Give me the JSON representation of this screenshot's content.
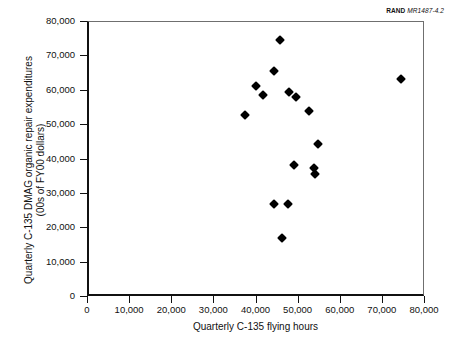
{
  "credit": {
    "brand": "RAND",
    "document_number": "MR1487-4.2"
  },
  "chart_data": {
    "type": "scatter",
    "title": "",
    "xlabel": "Quarterly C-135 flying hours",
    "ylabel": "Quarterly C-135 DMAG organic repair expenditures (00s of FY00 dollars)",
    "ylabel_line1": "Quarterly C-135 DMAG organic repair expenditures",
    "ylabel_line2": "(00s of FY00 dollars)",
    "xlim": [
      0,
      80000
    ],
    "ylim": [
      0,
      80000
    ],
    "grid": false,
    "legend": false,
    "marker": "filled-diamond",
    "marker_color": "#000000",
    "xticks": [
      0,
      10000,
      20000,
      30000,
      40000,
      50000,
      60000,
      70000,
      80000
    ],
    "yticks": [
      0,
      10000,
      20000,
      30000,
      40000,
      50000,
      60000,
      70000,
      80000
    ],
    "xticklabels": [
      "0",
      "10,000",
      "20,000",
      "30,000",
      "40,000",
      "50,000",
      "60,000",
      "70,000",
      "80,000"
    ],
    "yticklabels": [
      "0",
      "10,000",
      "20,000",
      "30,000",
      "40,000",
      "50,000",
      "60,000",
      "70,000",
      "80,000"
    ],
    "points": [
      {
        "x": 37500,
        "y": 52700
      },
      {
        "x": 40000,
        "y": 61200
      },
      {
        "x": 41800,
        "y": 58600
      },
      {
        "x": 44300,
        "y": 65500
      },
      {
        "x": 45900,
        "y": 74400
      },
      {
        "x": 44500,
        "y": 26800
      },
      {
        "x": 46400,
        "y": 17000
      },
      {
        "x": 47600,
        "y": 26800
      },
      {
        "x": 48000,
        "y": 59300
      },
      {
        "x": 49200,
        "y": 38000
      },
      {
        "x": 49600,
        "y": 57800
      },
      {
        "x": 52600,
        "y": 53700
      },
      {
        "x": 53900,
        "y": 37200
      },
      {
        "x": 54100,
        "y": 35600
      },
      {
        "x": 54800,
        "y": 44200
      },
      {
        "x": 74500,
        "y": 63100
      }
    ]
  }
}
